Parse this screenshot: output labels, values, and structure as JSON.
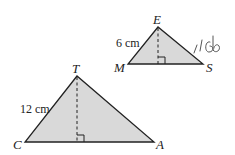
{
  "diagram": {
    "colors": {
      "fill": "#d9d9d9",
      "stroke": "#222222",
      "handwriting": "#555555"
    },
    "small_triangle": {
      "vertices": {
        "top": "E",
        "left": "M",
        "right": "S"
      },
      "side_label": "6 cm",
      "altitude": "dashed",
      "right_angle_marker": true
    },
    "large_triangle": {
      "vertices": {
        "top": "T",
        "left": "C",
        "right": "A"
      },
      "side_label": "12 cm",
      "altitude": "dashed",
      "right_angle_marker": true
    },
    "handwritten_annotation": "handwritten mark near side ES"
  }
}
